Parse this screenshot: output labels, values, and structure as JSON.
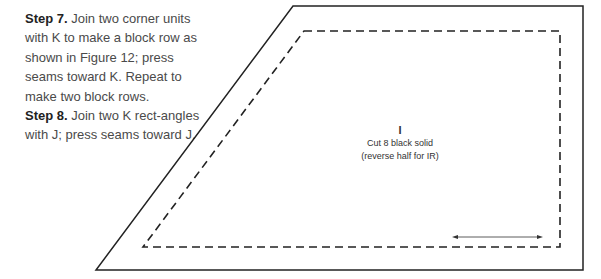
{
  "instructions": [
    {
      "label": "Step 7.",
      "text": " Join two corner units with K to make a block row as shown in Figure 12; press seams toward K. Repeat to make two block rows."
    },
    {
      "label": "Step 8.",
      "text": " Join two K rect-angles with J; press seams toward J."
    }
  ],
  "pattern_piece": {
    "letter": "I",
    "line1": "Cut 8 black solid",
    "line2": "(reverse half for IR)",
    "grainline": "double-headed-arrow"
  },
  "colors": {
    "outline": "#222222",
    "text": "#4a4a4a"
  }
}
